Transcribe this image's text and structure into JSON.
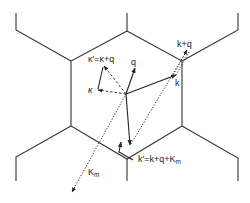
{
  "figure": {
    "colors": {
      "line": "#333333",
      "background": "#ffffff",
      "text": "#222222"
    }
  },
  "labels": {
    "kappa_relation": "κ'=κ+q",
    "kappa": "κ",
    "q": "q",
    "k_plus_q": "k+q",
    "k": "k",
    "k_prime_relation": "k'=k+q+K",
    "k_prime_relation_sub": "m",
    "K_m": "K",
    "K_m_sub": "m"
  },
  "vectors": [
    {
      "name": "q",
      "style": "solid",
      "from": [
        126,
        94
      ],
      "to": [
        135,
        68
      ]
    },
    {
      "name": "k",
      "style": "solid",
      "from": [
        126,
        94
      ],
      "to": [
        176,
        75
      ]
    },
    {
      "name": "kappa",
      "style": "dashed",
      "from": [
        126,
        94
      ],
      "to": [
        98,
        90
      ]
    },
    {
      "name": "kappa_prime",
      "style": "dashed",
      "from": [
        126,
        94
      ],
      "to": [
        104,
        66
      ]
    },
    {
      "name": "kappa_to_kappa_prime",
      "style": "solid",
      "from": [
        98,
        89
      ],
      "to": [
        104,
        66
      ]
    },
    {
      "name": "k_plus_q",
      "style": "dotted",
      "from": [
        172,
        76
      ],
      "to": [
        187,
        50
      ]
    },
    {
      "name": "K_m",
      "style": "dotted",
      "from": [
        126,
        94
      ],
      "to": [
        72,
        192
      ]
    },
    {
      "name": "k_prime",
      "style": "solid",
      "from": [
        126,
        94
      ],
      "to": [
        130,
        145
      ]
    },
    {
      "name": "k_plus_q_translated",
      "style": "dotted",
      "from": [
        130,
        145
      ],
      "to": [
        187,
        50
      ]
    }
  ]
}
